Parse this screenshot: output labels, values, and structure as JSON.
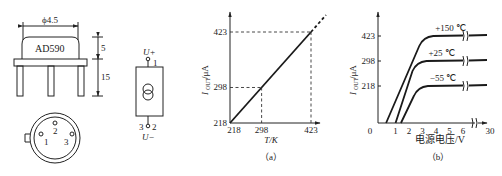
{
  "package_drawing": {
    "diameter_label": "ϕ4.5",
    "chip_label": "AD590",
    "dim_cap_height": "5",
    "dim_lead_length": "15",
    "pin_labels": [
      "1",
      "2",
      "3"
    ]
  },
  "symbol": {
    "top_label": "U+",
    "top_pin": "1",
    "bottom_pins": "3",
    "bottom_pin2": "2",
    "bottom_label": "U−"
  },
  "chart_data": [
    {
      "type": "line",
      "caption": "（a）",
      "xlabel": "T/K",
      "ylabel": "I_OUT/μA",
      "ylabel_main": "I",
      "ylabel_sub": "OUT",
      "ylabel_unit": "/μA",
      "x_ticks": [
        "218",
        "298",
        "423"
      ],
      "y_ticks": [
        "218",
        "298",
        "423"
      ],
      "xlim": [
        218,
        450
      ],
      "ylim": [
        218,
        450
      ],
      "series": [
        {
          "name": "I_OUT vs T",
          "x": [
            218,
            298,
            423
          ],
          "y": [
            218,
            298,
            423
          ]
        }
      ],
      "reference_lines": [
        {
          "x": 298,
          "y": 298
        },
        {
          "x": 423,
          "y": 423
        }
      ],
      "extrapolation": "dashed beyond 423"
    },
    {
      "type": "line",
      "caption": "（b）",
      "xlabel": "电源电压/V",
      "ylabel": "I_OUT/μA",
      "ylabel_main": "I",
      "ylabel_sub": "OUT",
      "ylabel_unit": "/μA",
      "x_ticks": [
        "0",
        "1",
        "2",
        "3",
        "4",
        "5",
        "6",
        "30"
      ],
      "y_ticks": [
        "218",
        "298",
        "423"
      ],
      "axis_break": "between 6 and 30",
      "series": [
        {
          "name": "+150 ℃",
          "label": "+150 ℃",
          "knee_x": 3.5,
          "start_x": 0.6,
          "y": 423
        },
        {
          "name": "+25 ℃",
          "label": "+25 ℃",
          "knee_x": 3.0,
          "start_x": 1.3,
          "y": 298
        },
        {
          "name": "-55 ℃",
          "label": "−55 ℃",
          "knee_x": 3.1,
          "start_x": 1.7,
          "y": 218
        }
      ]
    }
  ]
}
